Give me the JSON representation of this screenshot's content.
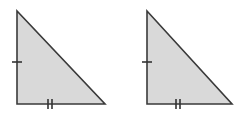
{
  "figure": {
    "background_color": "#ffffff",
    "canvas": {
      "width": 242,
      "height": 114
    },
    "style": {
      "fill_color": "#d9d9d9",
      "stroke_color": "#3a3a3a",
      "stroke_width": 1.6,
      "tick_color": "#333333",
      "tick_width": 1.6
    },
    "shapes": [
      {
        "name": "triangle-left",
        "kind": "right-triangle",
        "points": "17,11 17,104 105,104",
        "vertices": {
          "apex": {
            "x": 17,
            "y": 11
          },
          "right_angle": {
            "x": 17,
            "y": 104
          },
          "base_right": {
            "x": 105,
            "y": 104
          }
        },
        "ticks": {
          "vertical_leg": {
            "name": "single-tick",
            "count": 1,
            "orientation": "horizontal-dash",
            "center": {
              "x": 17,
              "y": 62
            },
            "half_length": 5,
            "spacing": 0
          },
          "horizontal_leg": {
            "name": "double-tick",
            "count": 2,
            "orientation": "vertical-dash",
            "center": {
              "x": 50,
              "y": 104
            },
            "half_length": 5,
            "spacing": 4
          }
        }
      },
      {
        "name": "triangle-right",
        "kind": "right-triangle",
        "points": "147,11 147,104 232,104",
        "vertices": {
          "apex": {
            "x": 147,
            "y": 11
          },
          "right_angle": {
            "x": 147,
            "y": 104
          },
          "base_right": {
            "x": 232,
            "y": 104
          }
        },
        "ticks": {
          "vertical_leg": {
            "name": "single-tick",
            "count": 1,
            "orientation": "horizontal-dash",
            "center": {
              "x": 147,
              "y": 62
            },
            "half_length": 5,
            "spacing": 0
          },
          "horizontal_leg": {
            "name": "double-tick",
            "count": 2,
            "orientation": "vertical-dash",
            "center": {
              "x": 178,
              "y": 104
            },
            "half_length": 5,
            "spacing": 4
          }
        }
      }
    ]
  }
}
